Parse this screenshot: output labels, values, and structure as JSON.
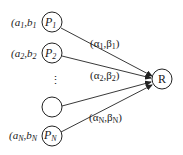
{
  "diagram": {
    "type": "network",
    "colors": {
      "stroke": "#222222",
      "background": "#ffffff",
      "text": "#1a1a1a"
    },
    "source_nodes": [
      {
        "id": "P1",
        "label": "P",
        "sub": "1",
        "param_label": "(a",
        "param_sub_a": "1",
        "param_mid": ",b",
        "param_sub_b": "1"
      },
      {
        "id": "P2",
        "label": "P",
        "sub": "2",
        "param_label": "(a",
        "param_sub_a": "2",
        "param_mid": ",b",
        "param_sub_b": "2"
      },
      {
        "id": "blank",
        "label": "",
        "sub": ""
      },
      {
        "id": "PN",
        "label": "P",
        "sub": "N",
        "param_label": "(a",
        "param_sub_a": "N",
        "param_mid": ",b",
        "param_sub_b": "N"
      }
    ],
    "ellipsis": "⋮",
    "target_node": {
      "id": "R",
      "label": "R"
    },
    "edges": [
      {
        "from": "P1",
        "to": "R",
        "label_open": "(α",
        "sub_a": "1",
        "label_mid": ",β",
        "sub_b": "1",
        "label_close": ")"
      },
      {
        "from": "P2",
        "to": "R",
        "label_open": "(α",
        "sub_a": "2",
        "label_mid": ",β",
        "sub_b": "2",
        "label_close": ")"
      },
      {
        "from": "blank",
        "to": "R"
      },
      {
        "from": "PN",
        "to": "R",
        "label_open": "(α",
        "sub_a": "N",
        "label_mid": ",β",
        "sub_b": "N",
        "label_close": ")"
      }
    ]
  }
}
